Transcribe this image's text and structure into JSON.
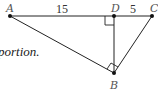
{
  "text_fragment": "portion.",
  "diagram": {
    "points": {
      "A": {
        "label": "A",
        "x": 10,
        "y": 16
      },
      "D": {
        "label": "D",
        "x": 114,
        "y": 16
      },
      "C": {
        "label": "C",
        "x": 152,
        "y": 16
      },
      "B": {
        "label": "B",
        "x": 114,
        "y": 73
      }
    },
    "segment_labels": {
      "AD": "15",
      "DC": "5"
    },
    "right_angles": [
      "at D (BD ⟂ AC)",
      "at B (AB ⟂ BC)"
    ],
    "colors": {
      "line": "#222222",
      "label": "#555555"
    }
  }
}
